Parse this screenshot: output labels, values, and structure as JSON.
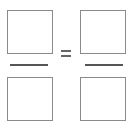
{
  "proportion": {
    "left_fraction": {
      "numerator": {
        "value": "",
        "placeholder": ""
      },
      "denominator": {
        "value": "",
        "placeholder": ""
      }
    },
    "right_fraction": {
      "numerator": {
        "value": "",
        "placeholder": ""
      },
      "denominator": {
        "value": "",
        "placeholder": ""
      }
    },
    "operator": "=",
    "colors": {
      "box_border": "#8a8a8a",
      "fraction_bar": "#555555",
      "equals_sign": "#666666"
    }
  }
}
